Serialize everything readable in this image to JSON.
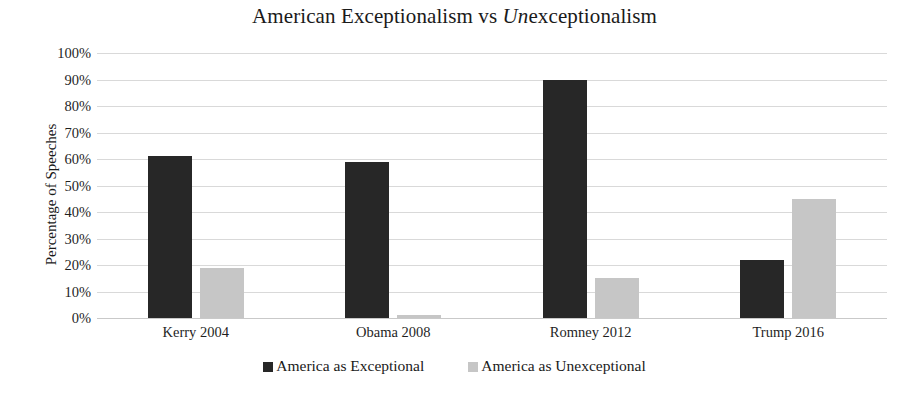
{
  "chart_data": {
    "type": "bar",
    "title": "American Exceptionalism vs Unexceptionalism",
    "title_plain_prefix": "American Exceptionalism vs ",
    "title_italic_part": "Un",
    "title_suffix": "exceptionalism",
    "xlabel": "",
    "ylabel": "Percentage of Speeches",
    "categories": [
      "Kerry 2004",
      "Obama 2008",
      "Romney 2012",
      "Trump 2016"
    ],
    "series": [
      {
        "name": "America as Exceptional",
        "color": "#272727",
        "values": [
          61,
          59,
          90,
          22
        ]
      },
      {
        "name": "America as Unexceptional",
        "color": "#c6c6c6",
        "values": [
          19,
          1,
          15,
          45
        ]
      }
    ],
    "ylim": [
      0,
      100
    ],
    "y_ticks": [
      "0%",
      "10%",
      "20%",
      "30%",
      "40%",
      "50%",
      "60%",
      "70%",
      "80%",
      "90%",
      "100%"
    ],
    "y_tick_values": [
      0,
      10,
      20,
      30,
      40,
      50,
      60,
      70,
      80,
      90,
      100
    ],
    "grid": true,
    "grid_color": "#d9d9d9",
    "legend_position": "bottom",
    "background": "#ffffff"
  }
}
